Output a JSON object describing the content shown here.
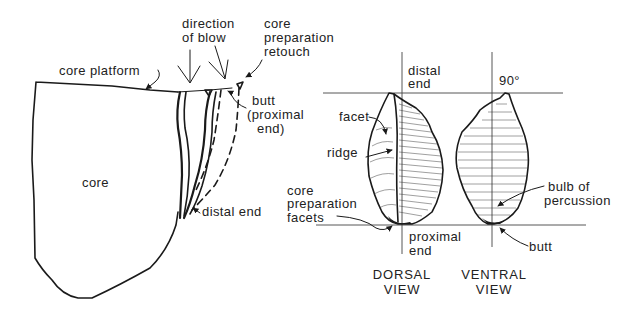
{
  "figure": {
    "left_panel": {
      "title": "Core and flake removal",
      "labels": {
        "core_platform": "core platform",
        "core": "core",
        "direction_of_blow_line1": "direction",
        "direction_of_blow_line2": "of blow",
        "core_prep_retouch_line1": "core",
        "core_prep_retouch_line2": "preparation",
        "core_prep_retouch_line3": "retouch",
        "butt_line1": "butt",
        "butt_line2": "(proximal",
        "butt_line3": "end)",
        "distal_end": "distal end"
      }
    },
    "right_panel": {
      "title": "Flake views",
      "labels": {
        "distal_end_line1": "distal",
        "distal_end_line2": "end",
        "angle": "90°",
        "facet": "facet",
        "ridge": "ridge",
        "core_prep_facets_line1": "core",
        "core_prep_facets_line2": "preparation",
        "core_prep_facets_line3": "facets",
        "proximal_end_line1": "proximal",
        "proximal_end_line2": "end",
        "bulb_line1": "bulb of",
        "bulb_line2": "percussion",
        "butt": "butt"
      },
      "captions": {
        "dorsal_line1": "DORSAL",
        "dorsal_line2": "VIEW",
        "ventral_line1": "VENTRAL",
        "ventral_line2": "VIEW"
      }
    },
    "colors": {
      "ink": "#1a1a1a",
      "background": "#ffffff"
    }
  }
}
